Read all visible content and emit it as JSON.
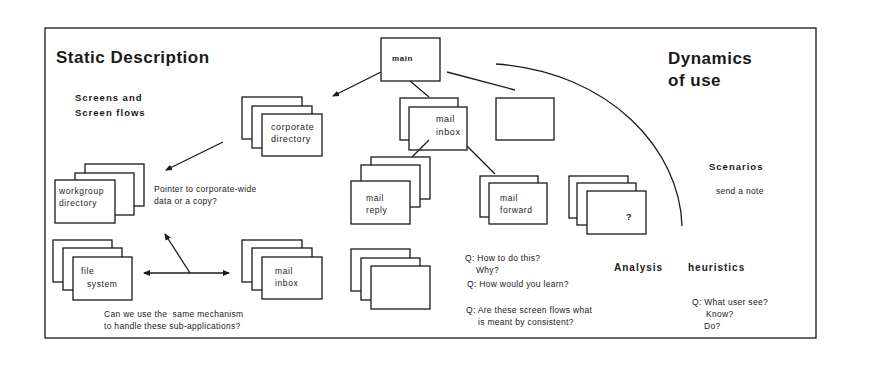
{
  "titles": {
    "static": "Static Description",
    "dynamics_1": "Dynamics",
    "dynamics_2": "of use"
  },
  "sections": {
    "screens_1": "Screens and",
    "screens_2": "Screen flows",
    "scenarios": "Scenarios",
    "scenario_item": "send a note",
    "analysis": "Analysis",
    "heuristics": "heuristics"
  },
  "screens": {
    "main": "main",
    "corporate_1": "corporate",
    "corporate_2": "directory",
    "mail_inbox_1": "mail",
    "mail_inbox_2": "inbox",
    "mail_reply_1": "mail",
    "mail_reply_2": "reply",
    "mail_forward_1": "mail",
    "mail_forward_2": "forward",
    "unknown": "?",
    "workgroup_1": "workgroup",
    "workgroup_2": "directory",
    "file_1": "file",
    "file_2": "system",
    "mail_inbox_b_1": "mail",
    "mail_inbox_b_2": "inbox"
  },
  "notes": {
    "pointer_1": "Pointer to corporate-wide",
    "pointer_2": "data or a copy?",
    "mechanism_1": "Can we use the  same mechanism",
    "mechanism_2": "to handle these sub-applications?",
    "q1a": "Q: How to do this?",
    "q1b": "Why?",
    "q2": "Q: How would you learn?",
    "q3a": "Q: Are these screen flows what",
    "q3b": "is meant by consistent?",
    "q4a": "Q: What user see?",
    "q4b": "Know?",
    "q4c": "Do?"
  },
  "colors": {
    "ink": "#1a1a1a",
    "paper": "#ffffff"
  }
}
